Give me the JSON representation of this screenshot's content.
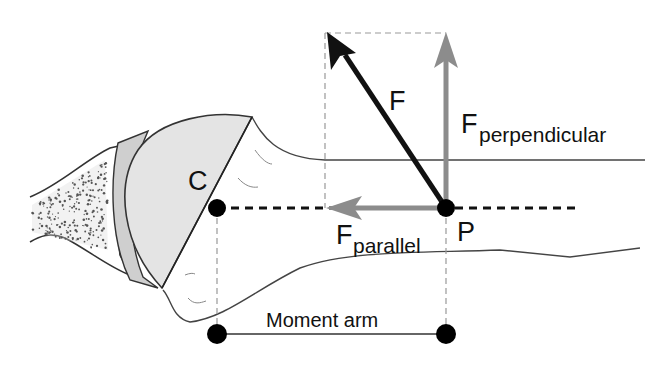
{
  "diagram": {
    "labels": {
      "center": "C",
      "point": "P",
      "force": "F",
      "perpendicular_main": "F",
      "perpendicular_sub": "perpendicular",
      "parallel_main": "F",
      "parallel_sub": "parallel",
      "moment_arm": "Moment arm"
    },
    "colors": {
      "force_vector": "#111111",
      "component_vector": "#8c8c8c",
      "bone_head_fill": "#e2e2e2",
      "cartilage_fill": "#c8c8c8",
      "outline": "#333333",
      "dashed_guide": "#999999"
    },
    "points": {
      "C": [
        217,
        208
      ],
      "P": [
        446,
        208
      ],
      "F_tip": [
        328,
        33
      ],
      "F_perp_tip": [
        446,
        33
      ],
      "F_par_tip": [
        328,
        208
      ],
      "arm_left": [
        217,
        334
      ],
      "arm_right": [
        446,
        334
      ]
    }
  }
}
